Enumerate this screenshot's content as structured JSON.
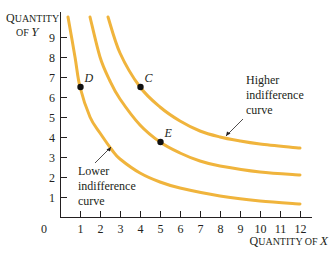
{
  "chart_data": {
    "type": "line",
    "title": "",
    "xlabel": "Quantity of X",
    "ylabel": "Quantity of Y",
    "xlim": [
      0,
      12.8
    ],
    "ylim": [
      0,
      10
    ],
    "x_ticks": [
      1,
      2,
      3,
      4,
      5,
      6,
      7,
      8,
      9,
      10,
      11,
      12
    ],
    "y_ticks": [
      1,
      2,
      3,
      4,
      5,
      6,
      7,
      8,
      9
    ],
    "origin_label": "0",
    "grid": false,
    "curve_color": "#f0b43c",
    "series": [
      {
        "name": "Lower indifference curve",
        "points": [
          [
            0.4,
            10
          ],
          [
            0.75,
            8
          ],
          [
            1,
            6.5
          ],
          [
            1.5,
            5
          ],
          [
            2,
            4.2
          ],
          [
            2.6,
            3.35
          ],
          [
            3,
            2.9
          ],
          [
            4,
            2.2
          ],
          [
            5,
            1.75
          ],
          [
            6,
            1.45
          ],
          [
            8,
            1.05
          ],
          [
            10,
            0.8
          ],
          [
            12,
            0.65
          ]
        ]
      },
      {
        "name": "Middle indifference curve",
        "points": [
          [
            1.5,
            10
          ],
          [
            2,
            8
          ],
          [
            2.5,
            6.8
          ],
          [
            3,
            5.9
          ],
          [
            4,
            4.6
          ],
          [
            5,
            3.75
          ],
          [
            6,
            3.2
          ],
          [
            7,
            2.8
          ],
          [
            8,
            2.55
          ],
          [
            10,
            2.25
          ],
          [
            12,
            2.1
          ]
        ]
      },
      {
        "name": "Higher indifference curve",
        "points": [
          [
            2.4,
            10
          ],
          [
            3,
            8.2
          ],
          [
            4,
            6.5
          ],
          [
            5,
            5.5
          ],
          [
            6,
            4.8
          ],
          [
            7,
            4.3
          ],
          [
            8,
            4.0
          ],
          [
            9,
            3.8
          ],
          [
            10,
            3.65
          ],
          [
            12,
            3.45
          ]
        ]
      }
    ],
    "labeled_points": [
      {
        "label": "D",
        "x": 1,
        "y": 6.5,
        "curve": "Lower indifference curve"
      },
      {
        "label": "C",
        "x": 4,
        "y": 6.5,
        "curve": "Higher indifference curve"
      },
      {
        "label": "E",
        "x": 5,
        "y": 3.75,
        "curve": "Middle indifference curve"
      }
    ],
    "annotations": [
      {
        "text": [
          "Higher",
          "indifference",
          "curve"
        ],
        "points_to": "Higher indifference curve"
      },
      {
        "text": [
          "Lower",
          "indifference",
          "curve"
        ],
        "points_to": "Lower indifference curve"
      }
    ]
  },
  "labels": {
    "y_axis_line1_cap": "Q",
    "y_axis_line1_rest": "UANTITY",
    "y_axis_line2_of": "OF ",
    "y_axis_line2_var": "Y",
    "x_axis_cap": "Q",
    "x_axis_rest": "UANTITY OF ",
    "x_axis_var": "X",
    "higher_1": "Higher",
    "higher_2": "indifference",
    "higher_3": "curve",
    "lower_1": "Lower",
    "lower_2": "indifference",
    "lower_3": "curve"
  }
}
